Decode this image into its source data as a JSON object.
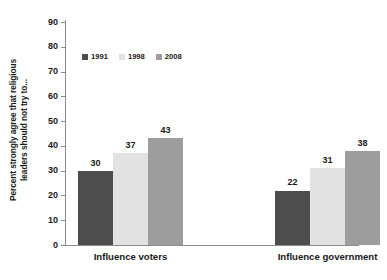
{
  "chart_data": {
    "type": "bar",
    "title": "",
    "xlabel": "",
    "ylabel": "Percent strongly agree that religious leaders should not try to...",
    "ylabel_lines": [
      "Percent strongly agree that religious",
      "leaders should not try to..."
    ],
    "categories": [
      "Influence voters",
      "Influence government"
    ],
    "series": [
      {
        "name": "1991",
        "values": [
          30,
          22
        ],
        "color": "#4d4d4d"
      },
      {
        "name": "1998",
        "values": [
          37,
          31
        ],
        "color": "#e2e2e2"
      },
      {
        "name": "2008",
        "values": [
          43,
          38
        ],
        "color": "#9d9d9d"
      }
    ],
    "ylim": [
      0,
      90
    ],
    "yticks": [
      0,
      10,
      20,
      30,
      40,
      50,
      60,
      70,
      80,
      90
    ],
    "ytick_labels": [
      "0",
      "10",
      "20",
      "30",
      "40",
      "50",
      "60",
      "70",
      "80",
      "90"
    ],
    "grid": false,
    "legend_position": "top-left-inside",
    "data_labels": [
      {
        "value": "30"
      },
      {
        "value": "37"
      },
      {
        "value": "43"
      },
      {
        "value": "22"
      },
      {
        "value": "31"
      },
      {
        "value": "38"
      }
    ],
    "axis_color": "#8c8c8c",
    "background": "#ffffff"
  },
  "legend": {
    "items": [
      {
        "label": "1991",
        "color": "#4d4d4d"
      },
      {
        "label": "1998",
        "color": "#e2e2e2"
      },
      {
        "label": "2008",
        "color": "#9d9d9d"
      }
    ]
  }
}
